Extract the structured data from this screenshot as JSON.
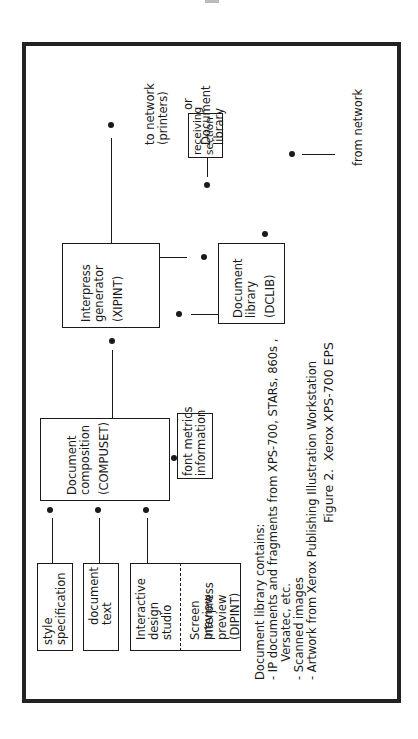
{
  "page": {
    "marker": ""
  },
  "boxes": {
    "style_spec": {
      "lines": [
        "style",
        "specification"
      ]
    },
    "document_text": {
      "lines": [
        "document",
        "text"
      ]
    },
    "interactive_design": {
      "lines": [
        "Interactive",
        "design",
        "studio"
      ]
    },
    "screen_preview": {
      "lines": [
        "Screen",
        "preview"
      ]
    },
    "interpress_preview": {
      "lines": [
        "Interpress",
        "preview",
        "(DIPINT)"
      ]
    },
    "compuset": {
      "lines": [
        "Document",
        "composition",
        "(COMPUSET)"
      ]
    },
    "font_metrics": {
      "lines": [
        "font metrics",
        "information"
      ]
    },
    "xipint": {
      "lines": [
        "Interpress",
        "generator",
        "(XIPINT)"
      ]
    },
    "dclib": {
      "lines": [
        "Document",
        "library",
        "(DCLIB)"
      ]
    },
    "receiving": {
      "lines": [
        "receiving",
        "section"
      ]
    }
  },
  "labels": {
    "to_network": {
      "lines": [
        "to network",
        "(printers)"
      ]
    },
    "or": "or",
    "document_library": {
      "lines": [
        "Document",
        "library"
      ]
    },
    "from_network": "from network"
  },
  "note": {
    "lines": [
      "Document library contains:",
      "- IP documents and fragments from XPS-700, STARs, 860s ,",
      "     Versatec, etc.",
      "- Scanned images",
      "- Artwork from Xerox Publishing Illustration Workstation"
    ]
  },
  "caption": "Figure 2.  Xerox XPS-700 EPS"
}
